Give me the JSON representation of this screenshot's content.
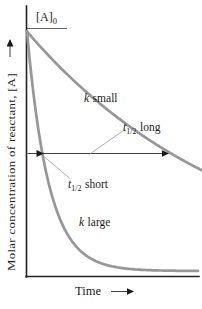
{
  "figure": {
    "background": "#ffffff",
    "curve_color": "#979797",
    "axis_color": "#222222",
    "text_color": "#1c1c1c"
  },
  "labels": {
    "y_axis": "Molar concentration of reactant, [A]",
    "x_axis": "Time",
    "initial_concentration": {
      "main": "[A]",
      "sub": "0"
    },
    "k_small": {
      "var": "k",
      "rest": "small"
    },
    "k_large": {
      "var": "k",
      "rest": "large"
    },
    "t_half_long": {
      "var": "t",
      "sub": "1/2",
      "rest": "long"
    },
    "t_half_short": {
      "var": "t",
      "sub": "1/2",
      "rest": "short"
    }
  },
  "chart_data": {
    "type": "line",
    "title": "",
    "xlabel": "Time",
    "ylabel": "Molar concentration of reactant, [A]",
    "y_start_label": "[A]0",
    "x_range": [
      0,
      1
    ],
    "y_range": [
      0,
      1
    ],
    "series": [
      {
        "id": "k-small",
        "label": "k small",
        "half_life_label": "t1/2 long",
        "half_life_fraction_of_axis": 0.843,
        "start_value_fraction": 1.0,
        "shape": "exponential-decay"
      },
      {
        "id": "k-large",
        "label": "k large",
        "half_life_label": "t1/2 short",
        "half_life_fraction_of_axis": 0.087,
        "start_value_fraction": 1.0,
        "shape": "exponential-decay"
      }
    ],
    "annotations": [
      "horizontal arrow at half the initial concentration ([A]0/2) with arrowheads at each curve's half-life crossing",
      "tick line at [A]0 on the concentration axis"
    ],
    "grid": false,
    "legend": "inline curve labels"
  }
}
